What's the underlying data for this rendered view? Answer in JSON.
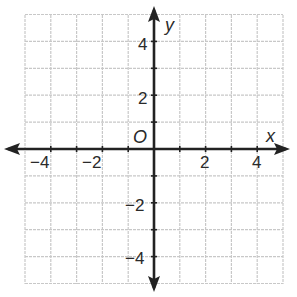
{
  "chart_data": {
    "type": "coordinate-plane",
    "title": "",
    "xlabel": "x",
    "ylabel": "y",
    "origin_label": "O",
    "xlim": [
      -5,
      5
    ],
    "ylim": [
      -5,
      5
    ],
    "grid": true,
    "grid_step": 1,
    "x_tick_labels": [
      "-4",
      "-2",
      "2",
      "4"
    ],
    "x_tick_values": [
      -4,
      -2,
      2,
      4
    ],
    "y_tick_labels": [
      "4",
      "2",
      "-2",
      "-4"
    ],
    "y_tick_values": [
      4,
      2,
      -2,
      -4
    ],
    "series": [],
    "axes_arrows": true,
    "colors": {
      "grid": "#c8c8c8",
      "axis": "#222222",
      "text": "#2a2a2a"
    }
  },
  "labels": {
    "x_axis": "x",
    "y_axis": "y",
    "origin": "O",
    "x_neg4": "−4",
    "x_neg2": "−2",
    "x_pos2": "2",
    "x_pos4": "4",
    "y_pos4": "4",
    "y_pos2": "2",
    "y_neg2": "−2",
    "y_neg4": "−4"
  }
}
